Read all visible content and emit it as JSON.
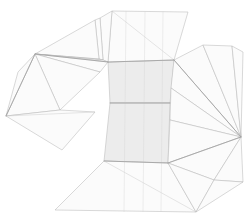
{
  "figure": {
    "kind": "wireframe-net",
    "width": 250,
    "height": 221,
    "background_color": "#ffffff",
    "stroke_color": "#b9b9b9",
    "seam_color": "#9a9a9a",
    "core_fill": "#ececec",
    "flap_fill": "#fcfcfc"
  },
  "chart_data": {
    "type": "diagram",
    "subtitle": "",
    "xlabel": "",
    "ylabel": "",
    "grid": false,
    "legend": "none",
    "xlim": [
      0,
      250
    ],
    "ylim": [
      0,
      221
    ],
    "annotations": [],
    "groups": [
      {
        "name": "core-band",
        "label": "Central hatched band",
        "fill": "#ececec",
        "polygons": [
          [
            [
              108,
              62
            ],
            [
              174,
              60
            ],
            [
              170,
              103
            ],
            [
              110,
              103
            ]
          ],
          [
            [
              110,
              103
            ],
            [
              170,
              103
            ],
            [
              168,
              163
            ],
            [
              104,
              161
            ]
          ]
        ]
      },
      {
        "name": "top-flap",
        "label": "Top trapezoid flap",
        "fill": "#fcfcfc",
        "polygons": [
          [
            [
              112,
              11
            ],
            [
              188,
              12
            ],
            [
              174,
              60
            ],
            [
              108,
              62
            ]
          ]
        ],
        "inner_edges": [
          [
            [
              112,
              11
            ],
            [
              174,
              60
            ]
          ]
        ]
      },
      {
        "name": "top-left-sliver",
        "label": "Upper-left narrow sliver flaps",
        "fill": "#fdfdfd",
        "polygons": [
          [
            [
              100,
              18
            ],
            [
              112,
              11
            ],
            [
              108,
              62
            ],
            [
              103,
              60
            ]
          ],
          [
            [
              95,
              20
            ],
            [
              100,
              18
            ],
            [
              103,
              60
            ],
            [
              99,
              59
            ]
          ]
        ]
      },
      {
        "name": "left-fan",
        "label": "Left triangle fan",
        "fill": "#fbfbfb",
        "apex": [
          35,
          54
        ],
        "polygons": [
          [
            [
              35,
              54
            ],
            [
              95,
              20
            ],
            [
              99,
              59
            ]
          ],
          [
            [
              35,
              54
            ],
            [
              99,
              59
            ],
            [
              103,
              60
            ]
          ],
          [
            [
              35,
              54
            ],
            [
              103,
              60
            ],
            [
              108,
              62
            ]
          ],
          [
            [
              35,
              54
            ],
            [
              108,
              62
            ],
            [
              100,
              72
            ]
          ],
          [
            [
              35,
              54
            ],
            [
              100,
              72
            ],
            [
              60,
              110
            ]
          ],
          [
            [
              35,
              54
            ],
            [
              60,
              110
            ],
            [
              6,
              116
            ]
          ],
          [
            [
              35,
              54
            ],
            [
              6,
              116
            ],
            [
              18,
              72
            ]
          ]
        ]
      },
      {
        "name": "left-lower-flap",
        "label": "Left lower flap",
        "fill": "#fcfcfc",
        "polygons": [
          [
            [
              6,
              116
            ],
            [
              60,
              110
            ],
            [
              95,
              112
            ],
            [
              62,
              150
            ]
          ]
        ],
        "inner_edges": [
          [
            [
              6,
              116
            ],
            [
              95,
              112
            ]
          ]
        ]
      },
      {
        "name": "right-fan",
        "label": "Right triangle fan",
        "fill": "#fbfbfb",
        "apex": [
          241,
          137
        ],
        "polygons": [
          [
            [
              241,
              137
            ],
            [
              174,
              60
            ],
            [
              203,
              45
            ]
          ],
          [
            [
              241,
              137
            ],
            [
              203,
              45
            ],
            [
              232,
              46
            ]
          ],
          [
            [
              241,
              137
            ],
            [
              232,
              46
            ],
            [
              243,
              52
            ]
          ],
          [
            [
              241,
              137
            ],
            [
              171,
              88
            ],
            [
              174,
              60
            ]
          ],
          [
            [
              241,
              137
            ],
            [
              170,
              120
            ],
            [
              171,
              88
            ]
          ],
          [
            [
              241,
              137
            ],
            [
              168,
              163
            ],
            [
              170,
              120
            ]
          ],
          [
            [
              241,
              137
            ],
            [
              214,
              180
            ],
            [
              168,
              163
            ]
          ],
          [
            [
              241,
              137
            ],
            [
              243,
              182
            ],
            [
              214,
              180
            ]
          ]
        ]
      },
      {
        "name": "bottom-flap",
        "label": "Bottom trapezoid flap",
        "fill": "#fcfcfc",
        "polygons": [
          [
            [
              104,
              161
            ],
            [
              168,
              163
            ],
            [
              196,
              212
            ],
            [
              55,
              210
            ]
          ]
        ],
        "inner_edges": [
          [
            [
              104,
              161
            ],
            [
              196,
              212
            ]
          ]
        ]
      },
      {
        "name": "bottom-right-flap",
        "label": "Bottom-right overlap flap",
        "fill": "#fdfdfd",
        "polygons": [
          [
            [
              168,
              163
            ],
            [
              214,
              180
            ],
            [
              196,
              212
            ]
          ],
          [
            [
              196,
              212
            ],
            [
              214,
              180
            ],
            [
              243,
              182
            ]
          ]
        ]
      }
    ],
    "seams": [
      [
        [
          108,
          62
        ],
        [
          174,
          60
        ]
      ],
      [
        [
          110,
          103
        ],
        [
          170,
          103
        ]
      ],
      [
        [
          104,
          161
        ],
        [
          168,
          163
        ]
      ],
      [
        [
          35,
          54
        ],
        [
          108,
          62
        ]
      ],
      [
        [
          35,
          54
        ],
        [
          6,
          116
        ]
      ],
      [
        [
          241,
          137
        ],
        [
          174,
          60
        ]
      ],
      [
        [
          241,
          137
        ],
        [
          168,
          163
        ]
      ]
    ]
  }
}
